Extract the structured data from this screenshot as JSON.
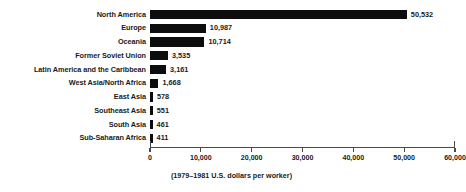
{
  "chart_data": {
    "type": "bar",
    "orientation": "horizontal",
    "title": "",
    "subtitle": "",
    "xlabel": "(1979–1981 U.S. dollars per worker)",
    "ylabel": "",
    "xlim": [
      0,
      60000
    ],
    "grid": false,
    "legend": null,
    "xticks": [
      {
        "value": 0,
        "label": "0"
      },
      {
        "value": 10000,
        "label": "10,000"
      },
      {
        "value": 20000,
        "label": "20,000"
      },
      {
        "value": 30000,
        "label": "30,000"
      },
      {
        "value": 40000,
        "label": "40,000"
      },
      {
        "value": 50000,
        "label": "50,000"
      },
      {
        "value": 60000,
        "label": "60,000"
      }
    ],
    "categories": [
      "North America",
      "Europe",
      "Oceania",
      "Former Soviet Union",
      "Latin America and the Caribbean",
      "West Asia/North Africa",
      "East Asia",
      "Southeast Asia",
      "South Asia",
      "Sub-Saharan Africa"
    ],
    "values": [
      50532,
      10987,
      10714,
      3535,
      3161,
      1668,
      578,
      551,
      461,
      411
    ],
    "value_labels": [
      "50,532",
      "10,987",
      "10,714",
      "3,535",
      "3,161",
      "1,668",
      "578",
      "551",
      "461",
      "411"
    ],
    "bar_color": "#0d0d0d",
    "axis_color": "#4a4a4a",
    "text_color": "#1a1a1a"
  }
}
